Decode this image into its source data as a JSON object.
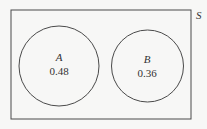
{
  "diagram": {
    "type": "venn",
    "sample_space_label": "S",
    "sets": [
      {
        "name": "A",
        "probability": "0.48"
      },
      {
        "name": "B",
        "probability": "0.36"
      }
    ],
    "overlap": "none",
    "colors": {
      "stroke": "#4a4a4a",
      "background": "#f7f7f6",
      "text": "#333333"
    }
  }
}
